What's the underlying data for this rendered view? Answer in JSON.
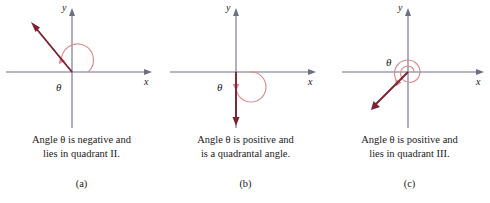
{
  "figure": {
    "background_color": "#ffffff",
    "axis_color": "#6b6f83",
    "ray_color": "#7b2233",
    "arc_color": "#d98f95",
    "text_color": "#1a1a1a"
  },
  "panels": [
    {
      "id": "a",
      "label": "(a)",
      "caption_line1": "Angle θ is negative and",
      "caption_line2": "lies in quadrant II.",
      "theta_symbol": "θ",
      "x_axis_label": "x",
      "y_axis_label": "y",
      "angle_sign": "negative",
      "quadrant": "II",
      "terminal_ray_angle_deg": 133,
      "arc_sweep_deg": -227,
      "arc_direction": "clockwise"
    },
    {
      "id": "b",
      "label": "(b)",
      "caption_line1": "Angle θ is positive and",
      "caption_line2": "is a quadrantal angle.",
      "theta_symbol": "θ",
      "x_axis_label": "x",
      "y_axis_label": "y",
      "angle_sign": "positive",
      "quadrant": "quadrantal",
      "terminal_ray_angle_deg": 270,
      "arc_sweep_deg": 270,
      "arc_direction": "counterclockwise"
    },
    {
      "id": "c",
      "label": "(c)",
      "caption_line1": "Angle θ is positive and",
      "caption_line2": "lies in quadrant III.",
      "theta_symbol": "θ",
      "x_axis_label": "x",
      "y_axis_label": "y",
      "angle_sign": "positive",
      "quadrant": "III",
      "terminal_ray_angle_deg": 225,
      "arc_sweep_deg": 585,
      "arc_direction": "counterclockwise"
    }
  ]
}
